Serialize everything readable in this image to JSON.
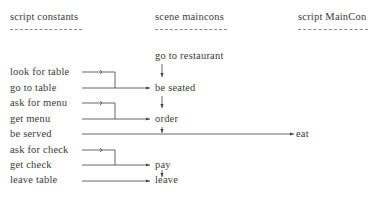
{
  "headers": {
    "left": "script constants",
    "middle": "scene maincons",
    "right": "script MainCon"
  },
  "scene": {
    "start": "go to restaurant",
    "steps": [
      "be seated",
      "order",
      "pay",
      "leave"
    ]
  },
  "script_constants": [
    "look for table",
    "go to table",
    "ask for menu",
    "get menu",
    "be served",
    "ask for check",
    "get check",
    "leave table"
  ],
  "main_con": {
    "result": "eat"
  }
}
